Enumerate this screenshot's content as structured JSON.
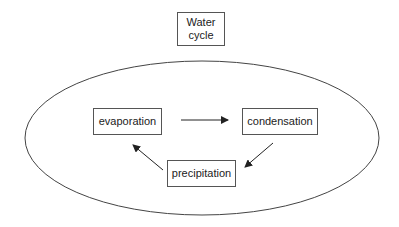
{
  "diagram": {
    "title": "Water\ncycle",
    "title_lines": [
      "Water",
      "cycle"
    ],
    "nodes": [
      {
        "id": "evaporation",
        "label": "evaporation"
      },
      {
        "id": "condensation",
        "label": "condensation"
      },
      {
        "id": "precipitation",
        "label": "precipitation"
      }
    ],
    "edges": [
      {
        "from": "evaporation",
        "to": "condensation"
      },
      {
        "from": "condensation",
        "to": "precipitation"
      },
      {
        "from": "precipitation",
        "to": "evaporation"
      }
    ],
    "colors": {
      "stroke": "#333333",
      "text": "#222222",
      "background": "#ffffff"
    }
  }
}
